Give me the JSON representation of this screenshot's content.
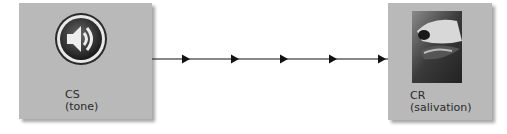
{
  "diagram": {
    "stimulus": {
      "label": "CS",
      "sublabel": "(tone)",
      "icon": "speaker-icon"
    },
    "response": {
      "label": "CR",
      "sublabel": "(salivation)",
      "image": "dog-photo"
    },
    "connector": {
      "arrowheads": 5,
      "color": "#111111"
    },
    "colors": {
      "box": "#b9b9b9",
      "text": "#2a2a2a"
    }
  }
}
